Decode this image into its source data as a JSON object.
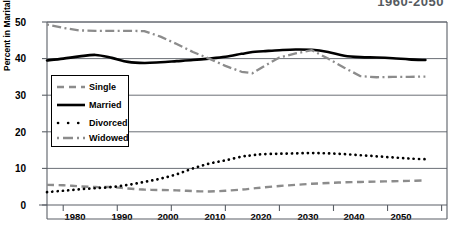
{
  "chart_data": {
    "type": "line",
    "title": "1960-2050",
    "xlabel": "",
    "ylabel": "Percent in Marital Category",
    "xlim": [
      1977,
      2051
    ],
    "ylim": [
      0,
      50
    ],
    "xticks": [
      1980,
      1990,
      2000,
      2010,
      2020,
      2030,
      2040,
      2050
    ],
    "yticks": [
      0,
      10,
      20,
      30,
      40,
      50
    ],
    "grid": true,
    "grid_axis": "y",
    "legend_position": "left-middle",
    "x": [
      1977,
      1980,
      1983,
      1986,
      1989,
      1992,
      1995,
      1998,
      2001,
      2004,
      2007,
      2010,
      2013,
      2015,
      2017,
      2020,
      2023,
      2026,
      2029,
      2032,
      2035,
      2038,
      2041,
      2044,
      2047
    ],
    "series": [
      {
        "name": "Single",
        "style": "dashed",
        "color": "#8c8c8c",
        "values": [
          5.5,
          5.4,
          5.1,
          4.9,
          4.9,
          4.5,
          4.2,
          4.1,
          4.0,
          3.8,
          3.7,
          3.9,
          4.2,
          4.5,
          4.8,
          5.2,
          5.5,
          5.8,
          6.0,
          6.2,
          6.3,
          6.4,
          6.5,
          6.6,
          6.7
        ]
      },
      {
        "name": "Married",
        "style": "solid",
        "color": "#000000",
        "values": [
          39.5,
          40.0,
          40.6,
          41.0,
          40.2,
          39.1,
          38.8,
          39.0,
          39.3,
          39.6,
          40.0,
          40.5,
          41.3,
          41.8,
          42.0,
          42.3,
          42.5,
          42.4,
          41.8,
          40.8,
          40.4,
          40.3,
          40.1,
          39.8,
          39.6
        ]
      },
      {
        "name": "Divorced",
        "style": "dotted",
        "color": "#000000",
        "values": [
          3.5,
          3.9,
          4.3,
          4.6,
          4.9,
          5.5,
          6.3,
          7.2,
          8.4,
          10.0,
          11.3,
          12.2,
          13.2,
          13.6,
          13.9,
          14.0,
          14.1,
          14.2,
          14.1,
          13.9,
          13.6,
          13.3,
          13.0,
          12.7,
          12.5
        ]
      },
      {
        "name": "Widowed",
        "style": "dashdot",
        "color": "#8c8c8c",
        "values": [
          49.3,
          48.4,
          47.7,
          47.6,
          47.6,
          47.6,
          47.5,
          46.0,
          44.0,
          41.8,
          40.0,
          38.0,
          36.4,
          36.0,
          37.8,
          40.3,
          41.4,
          42.3,
          40.0,
          37.5,
          35.2,
          34.9,
          35.0,
          35.0,
          35.1
        ]
      }
    ]
  },
  "axis": {
    "ytick_labels": [
      "50",
      "40",
      "30",
      "20",
      "10",
      "0"
    ],
    "xtick_labels": [
      "1980",
      "1990",
      "2000",
      "2010",
      "2020",
      "2030",
      "2040",
      "2050"
    ]
  },
  "legend": {
    "entries": [
      {
        "label": "Single",
        "swatch": "dashed-gray-line"
      },
      {
        "label": "Married",
        "swatch": "solid-black-line"
      },
      {
        "label": "Divorced",
        "swatch": "dotted-black-line"
      },
      {
        "label": "Widowed",
        "swatch": "dashdot-gray-line"
      }
    ]
  }
}
